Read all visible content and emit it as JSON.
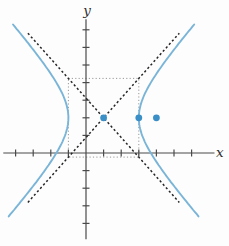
{
  "chart_data": {
    "type": "line",
    "xlabel": "x",
    "ylabel": "y",
    "xlim": [
      -4.7,
      7.3
    ],
    "ylim": [
      -4.9,
      7.6
    ],
    "x_ticks": [
      -4,
      -3,
      -2,
      -1,
      1,
      2,
      3,
      4,
      5,
      6
    ],
    "y_ticks": [
      -4,
      -3,
      -2,
      -1,
      1,
      2,
      3,
      4,
      5,
      6,
      7
    ],
    "grid": false,
    "hyperbola": {
      "orientation": "horizontal",
      "center": [
        1,
        2
      ],
      "a": 2,
      "b": 2.236,
      "y_range": [
        -3.6,
        7.3
      ]
    },
    "points": [
      {
        "name": "center",
        "x": 1,
        "y": 2
      },
      {
        "name": "vertex",
        "x": 3,
        "y": 2
      },
      {
        "name": "focus",
        "x": 4,
        "y": 2
      }
    ],
    "asymptotes": [
      {
        "slope": 1.118,
        "through": [
          1,
          2
        ],
        "x_range": [
          -3.3,
          5.3
        ]
      },
      {
        "slope": -1.118,
        "through": [
          1,
          2
        ],
        "x_range": [
          -3.3,
          5.3
        ]
      }
    ],
    "rectangle": {
      "x_range": [
        -1,
        3
      ],
      "y_range": [
        -0.236,
        4.236
      ]
    },
    "colors": {
      "curve": "#7ab5d8",
      "points": "#3a8fc7",
      "asymptote": "#262626",
      "rectangle": "#999999",
      "axis": "#4a4a4a",
      "background": "#fdfdfd"
    }
  }
}
